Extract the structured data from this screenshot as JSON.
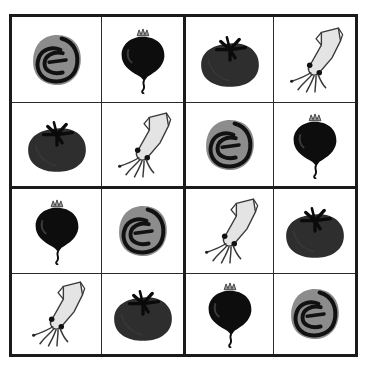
{
  "puzzle": {
    "type": "4x4 picture sudoku",
    "symbols": {
      "cabbage": {
        "icon": "cabbage-icon",
        "fill": "#8c8c8c",
        "stroke": "#111111"
      },
      "beet": {
        "icon": "beet-icon",
        "fill": "#0d0d0d",
        "leaf": "#9a9a9a"
      },
      "tomato": {
        "icon": "tomato-icon",
        "fill": "#2e2e2e",
        "stem": "#0a0a0a"
      },
      "squid": {
        "icon": "squid-icon",
        "fill": "#e4e4e4",
        "stroke": "#3a3a3a"
      }
    },
    "grid": [
      [
        "cabbage",
        "beet",
        "tomato",
        "squid"
      ],
      [
        "tomato",
        "squid",
        "cabbage",
        "beet"
      ],
      [
        "beet",
        "cabbage",
        "squid",
        "tomato"
      ],
      [
        "squid",
        "tomato",
        "beet",
        "cabbage"
      ]
    ]
  }
}
